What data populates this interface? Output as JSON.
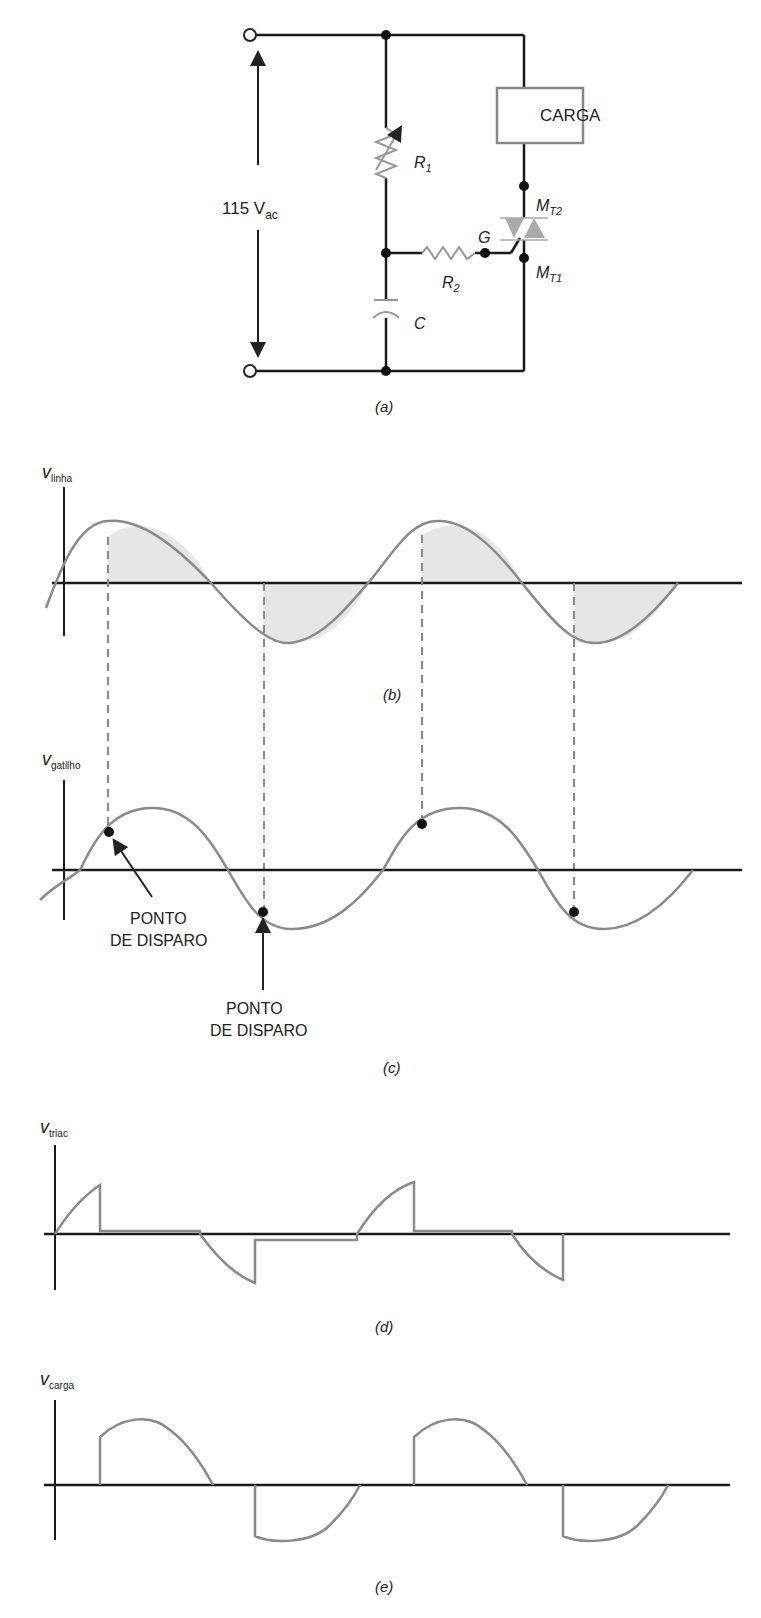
{
  "circuit": {
    "source_label": "115 V",
    "source_sub": "ac",
    "load_label": "CARGA",
    "r1": "R",
    "r1_sub": "1",
    "r2": "R",
    "r2_sub": "2",
    "cap": "C",
    "gate": "G",
    "mt2": "M",
    "mt2_sub": "T2",
    "mt1": "M",
    "mt1_sub": "T1",
    "caption": "(a)"
  },
  "panels": {
    "b": {
      "ylabel": "v",
      "ylabel_sub": "linha",
      "caption": "(b)"
    },
    "c": {
      "ylabel": "v",
      "ylabel_sub": "gatilho",
      "caption": "(c)",
      "annot1_l1": "PONTO",
      "annot1_l2": "DE DISPARO",
      "annot2_l1": "PONTO",
      "annot2_l2": "DE DISPARO"
    },
    "d": {
      "ylabel": "v",
      "ylabel_sub": "triac",
      "caption": "(d)"
    },
    "e": {
      "ylabel": "v",
      "ylabel_sub": "carga",
      "caption": "(e)"
    }
  },
  "colors": {
    "line": "#1a1a1a",
    "wave": "#8a8a8a",
    "fill": "#e6e6e6",
    "dash": "#888888"
  }
}
